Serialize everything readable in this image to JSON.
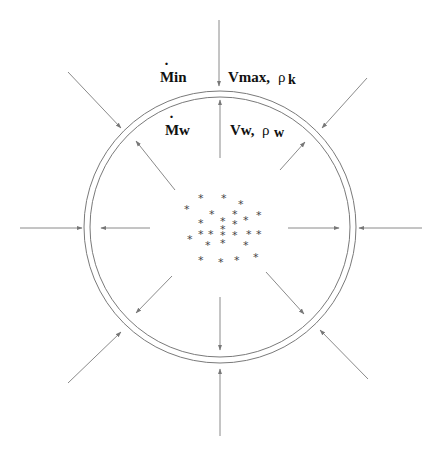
{
  "diagram": {
    "colors": {
      "line": "#8a8a8a",
      "ring": "#7a7a7a",
      "text": "#111111",
      "star": "#444444"
    },
    "labels": {
      "mdot_in": {
        "symbol": "M",
        "dot": "·",
        "suffix": "in"
      },
      "v_max": {
        "main": "Vmax,",
        "rho": "ρ",
        "sub": "k"
      },
      "mdot_w": {
        "symbol": "M",
        "dot": "·",
        "suffix": "w"
      },
      "v_w": {
        "main": "Vw,",
        "rho": "ρ",
        "sub": "w"
      }
    },
    "shell": {
      "layers": [
        "outer-ring",
        "inner-ring"
      ]
    },
    "arrows": {
      "inflow_directions": [
        "N",
        "NE",
        "E",
        "SE",
        "S",
        "SW",
        "W",
        "NW"
      ],
      "outflow_directions": [
        "N",
        "NE",
        "E",
        "SE",
        "S",
        "SW",
        "W",
        "NW"
      ]
    },
    "cluster": {
      "glyph": "*",
      "count": 27
    }
  }
}
